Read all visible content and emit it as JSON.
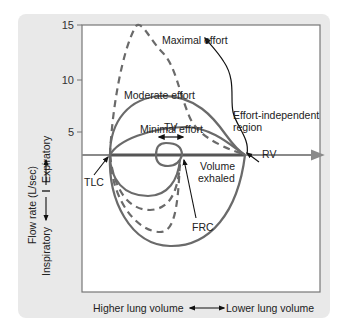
{
  "figure": {
    "y_axis": {
      "label": "Flow rate (L/sec)",
      "upper_direction": "Expiratory",
      "lower_direction": "Inspiratory",
      "ticks": [
        "15",
        "10",
        "5"
      ]
    },
    "x_axis": {
      "left_label": "Higher lung volume",
      "right_label": "Lower lung volume"
    },
    "annotations": {
      "maximal": "Maximal effort",
      "moderate": "Moderate effort",
      "minimal": "Minimal effort",
      "effort_independent_1": "Effort-independent",
      "effort_independent_2": "region",
      "tv": "TV",
      "rv": "RV",
      "tlc": "TLC",
      "frc": "FRC",
      "volume_exhaled_1": "Volume",
      "volume_exhaled_2": "exhaled"
    },
    "colors": {
      "panel_bg": "#e9e9e9",
      "plot_bg": "#ffffff",
      "curve": "#6a6a6a",
      "axis": "#8a8a8a",
      "text": "#222222"
    }
  }
}
